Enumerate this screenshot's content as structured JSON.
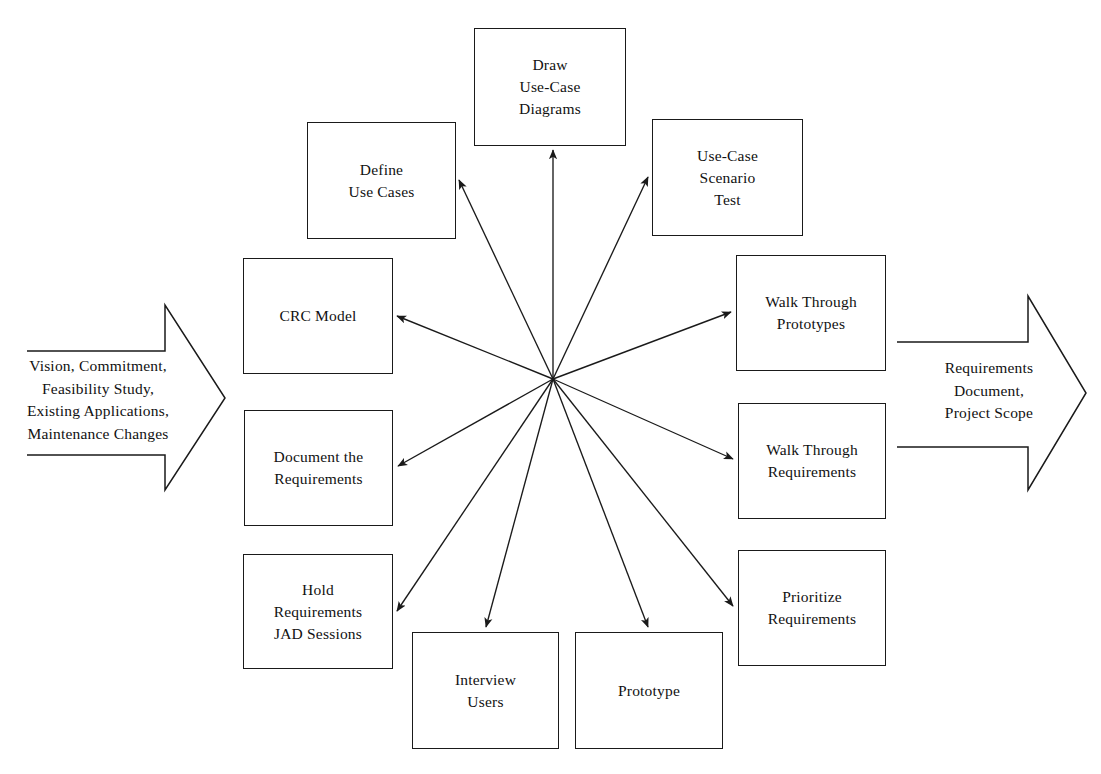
{
  "diagram": {
    "type": "hub-and-spoke process diagram",
    "stroke_color": "#1a1a1a",
    "background_color": "#ffffff",
    "hub": {
      "x": 553,
      "y": 379,
      "label": ""
    },
    "input_flow": {
      "name": "input-arrow",
      "direction": "right",
      "text": "Vision, Commitment,\nFeasibility Study,\nExisting Applications,\nMaintenance Changes"
    },
    "output_flow": {
      "name": "output-arrow",
      "direction": "right",
      "text": "Requirements\nDocument,\nProject Scope"
    },
    "boxes": [
      {
        "id": "draw-use-case-diagrams",
        "label": "Draw\nUse-Case\nDiagrams",
        "x": 474,
        "y": 28,
        "w": 152,
        "h": 118
      },
      {
        "id": "define-use-cases",
        "label": "Define\nUse Cases",
        "x": 307,
        "y": 122,
        "w": 149,
        "h": 117
      },
      {
        "id": "use-case-scenario-test",
        "label": "Use-Case\nScenario\nTest",
        "x": 652,
        "y": 119,
        "w": 151,
        "h": 117
      },
      {
        "id": "crc-model",
        "label": "CRC Model",
        "x": 243,
        "y": 258,
        "w": 150,
        "h": 116
      },
      {
        "id": "walk-through-prototypes",
        "label": "Walk Through\nPrototypes",
        "x": 736,
        "y": 255,
        "w": 150,
        "h": 116
      },
      {
        "id": "document-the-requirements",
        "label": "Document the\nRequirements",
        "x": 244,
        "y": 410,
        "w": 149,
        "h": 116
      },
      {
        "id": "walk-through-requirements",
        "label": "Walk Through\nRequirements",
        "x": 738,
        "y": 403,
        "w": 148,
        "h": 116
      },
      {
        "id": "hold-requirements-jad-sessions",
        "label": "Hold\nRequirements\nJAD Sessions",
        "x": 243,
        "y": 554,
        "w": 150,
        "h": 115
      },
      {
        "id": "prioritize-requirements",
        "label": "Prioritize\nRequirements",
        "x": 738,
        "y": 550,
        "w": 148,
        "h": 116
      },
      {
        "id": "interview-users",
        "label": "Interview\nUsers",
        "x": 412,
        "y": 632,
        "w": 147,
        "h": 117
      },
      {
        "id": "prototype",
        "label": "Prototype",
        "x": 575,
        "y": 632,
        "w": 148,
        "h": 117
      }
    ],
    "spokes": [
      {
        "to": "draw-use-case-diagrams",
        "x2": 553,
        "y2": 150
      },
      {
        "to": "define-use-cases",
        "x2": 459,
        "y2": 180
      },
      {
        "to": "use-case-scenario-test",
        "x2": 648,
        "y2": 177
      },
      {
        "to": "crc-model",
        "x2": 397,
        "y2": 316
      },
      {
        "to": "walk-through-prototypes",
        "x2": 731,
        "y2": 312
      },
      {
        "to": "document-the-requirements",
        "x2": 398,
        "y2": 466
      },
      {
        "to": "walk-through-requirements",
        "x2": 733,
        "y2": 459
      },
      {
        "to": "hold-requirements-jad-sessions",
        "x2": 397,
        "y2": 611
      },
      {
        "to": "prioritize-requirements",
        "x2": 733,
        "y2": 606
      },
      {
        "to": "interview-users",
        "x2": 486,
        "y2": 627
      },
      {
        "to": "prototype",
        "x2": 648,
        "y2": 627
      }
    ]
  }
}
